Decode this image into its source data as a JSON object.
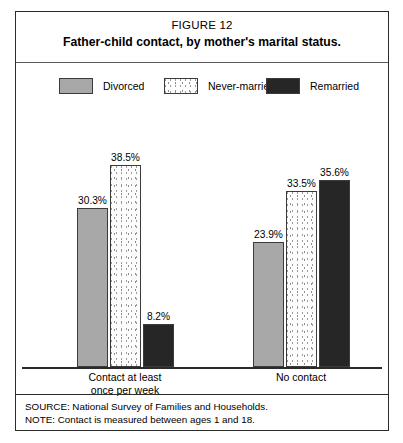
{
  "figure": {
    "number_label": "FIGURE 12",
    "title": "Father-child contact, by mother's marital status."
  },
  "legend": {
    "items": [
      {
        "label": "Divorced",
        "swatch": "solid-gray-swatch",
        "color": "#a8a8a8"
      },
      {
        "label": "Never-married",
        "swatch": "dotted-white-swatch",
        "color": "#ffffff"
      },
      {
        "label": "Remarried",
        "swatch": "solid-black-swatch",
        "color": "#262626"
      }
    ]
  },
  "footnotes": {
    "source": "SOURCE: National Survey of Families and Households.",
    "note": "NOTE: Contact is measured between ages 1 and 18."
  },
  "chart_data": {
    "type": "bar",
    "title": "Father-child contact, by mother's marital status.",
    "subtitle": "FIGURE 12",
    "xlabel": "",
    "ylabel": "",
    "ylim": [
      0,
      44
    ],
    "grid": false,
    "legend_position": "top",
    "value_suffix": "%",
    "categories": [
      "Contact at least once per week",
      "No contact"
    ],
    "category_lines": [
      [
        "Contact at least",
        "once per week"
      ],
      [
        "No contact"
      ]
    ],
    "series": [
      {
        "name": "Divorced",
        "color": "#a8a8a8",
        "values": [
          30.3,
          23.9
        ],
        "labels": [
          "30.3%",
          "23.9%"
        ]
      },
      {
        "name": "Never-married",
        "color": "#ffffff",
        "values": [
          38.5,
          33.5
        ],
        "labels": [
          "38.5%",
          "33.5%"
        ]
      },
      {
        "name": "Remarried",
        "color": "#262626",
        "values": [
          8.2,
          35.6
        ],
        "labels": [
          "8.2%",
          "35.6%"
        ]
      }
    ],
    "source": "SOURCE: National Survey of Families and Households.",
    "note": "NOTE: Contact is measured between ages 1 and 18."
  }
}
